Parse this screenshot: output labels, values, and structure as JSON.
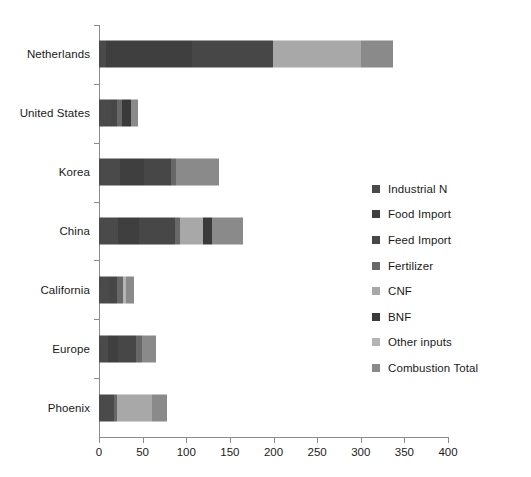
{
  "chart_data": {
    "type": "bar",
    "orientation": "horizontal",
    "stacked": true,
    "title": "",
    "xlabel": "",
    "ylabel": "",
    "xlim": [
      0,
      400
    ],
    "xticks": [
      0,
      50,
      100,
      150,
      200,
      250,
      300,
      350,
      400
    ],
    "grid": false,
    "legend_position": "right",
    "categories": [
      "Netherlands",
      "United States",
      "Korea",
      "China",
      "California",
      "Europe",
      "Phoenix"
    ],
    "series": [
      {
        "name": "Industrial N",
        "color": "#4a4a4a",
        "values": [
          8,
          14,
          24,
          22,
          12,
          10,
          17
        ]
      },
      {
        "name": "Food Import",
        "color": "#3f3f3f",
        "values": [
          99,
          0,
          28,
          24,
          0,
          12,
          0
        ]
      },
      {
        "name": "Feed Import",
        "color": "#474747",
        "values": [
          93,
          7,
          30,
          41,
          9,
          20,
          0
        ]
      },
      {
        "name": "Fertilizer",
        "color": "#686868",
        "values": [
          0,
          5,
          6,
          6,
          6,
          7,
          4
        ]
      },
      {
        "name": "CNF",
        "color": "#a8a8a8",
        "values": [
          100,
          0,
          0,
          26,
          0,
          0,
          40
        ]
      },
      {
        "name": "BNF",
        "color": "#3a3a3a",
        "values": [
          0,
          11,
          0,
          10,
          0,
          0,
          0
        ]
      },
      {
        "name": "Other inputs",
        "color": "#b4b4b4",
        "values": [
          0,
          0,
          0,
          0,
          4,
          0,
          0
        ]
      },
      {
        "name": "Combustion Total",
        "color": "#8a8a8a",
        "values": [
          37,
          8,
          50,
          36,
          9,
          16,
          17
        ]
      }
    ],
    "totals": [
      337,
      45,
      138,
      165,
      40,
      65,
      78
    ]
  },
  "legend": {
    "items": [
      {
        "label": "Industrial N",
        "color": "#4a4a4a"
      },
      {
        "label": "Food Import",
        "color": "#3f3f3f"
      },
      {
        "label": "Feed Import",
        "color": "#474747"
      },
      {
        "label": "Fertilizer",
        "color": "#686868"
      },
      {
        "label": "CNF",
        "color": "#a8a8a8"
      },
      {
        "label": "BNF",
        "color": "#3a3a3a"
      },
      {
        "label": "Other inputs",
        "color": "#b4b4b4"
      },
      {
        "label": "Combustion Total",
        "color": "#8a8a8a"
      }
    ]
  },
  "axis": {
    "tick_labels": [
      "0",
      "50",
      "100",
      "150",
      "200",
      "250",
      "300",
      "350",
      "400"
    ]
  }
}
